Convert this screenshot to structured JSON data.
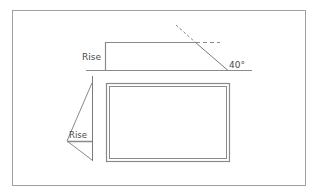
{
  "diagram": {
    "type": "roof-pitch technical drawing",
    "colors": {
      "line": "#8a8a8a",
      "frame": "#9a9a9a",
      "text": "#4a4a4a",
      "background": "#ffffff"
    },
    "top_view": {
      "rise_label": "Rise",
      "angle_label": "40°"
    },
    "side_view": {
      "rise_label": "Rise"
    },
    "rectangle": {
      "style": "double-border"
    }
  }
}
